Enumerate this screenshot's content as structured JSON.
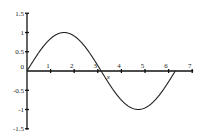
{
  "chart_data": {
    "type": "line",
    "title": "",
    "xlabel": "x",
    "ylabel": "",
    "xlim": [
      0,
      7
    ],
    "ylim": [
      -1.5,
      1.5
    ],
    "grid": false,
    "legend": null,
    "x_ticks": [
      {
        "value": 0,
        "label": "0"
      },
      {
        "value": 1,
        "label": "1"
      },
      {
        "value": 2,
        "label": "2"
      },
      {
        "value": 3,
        "label": "3"
      },
      {
        "value": 4,
        "label": "4"
      },
      {
        "value": 5,
        "label": "5"
      },
      {
        "value": 6,
        "label": "6"
      },
      {
        "value": 7,
        "label": "7"
      }
    ],
    "y_ticks": [
      {
        "value": 1.5,
        "label": "1.5"
      },
      {
        "value": 1,
        "label": "1"
      },
      {
        "value": 0.5,
        "label": "0.5"
      },
      {
        "value": -0.5,
        "label": "-0.5"
      },
      {
        "value": -1,
        "label": "-1"
      },
      {
        "value": -1.5,
        "label": "-1.5"
      }
    ],
    "series": [
      {
        "name": "sin(x)",
        "function": "sin(x)",
        "x": [
          0,
          0.5,
          1,
          1.5708,
          2,
          2.5,
          3,
          3.1416,
          3.5,
          4,
          4.5,
          4.7124,
          5,
          5.5,
          6,
          6.2832
        ],
        "y": [
          0,
          0.479,
          0.841,
          1,
          0.909,
          0.598,
          0.141,
          0,
          -0.351,
          -0.757,
          -0.978,
          -1,
          -0.959,
          -0.706,
          -0.279,
          0
        ]
      }
    ]
  }
}
